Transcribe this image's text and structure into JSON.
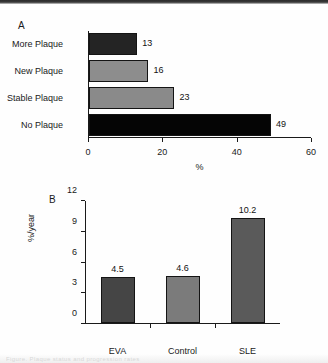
{
  "figure": {
    "background_color": "#fefefe",
    "ink_color": "#1a1a1a",
    "caption_ghost": "Figure. Plaque status and progression rates"
  },
  "panel_a": {
    "label": "A",
    "chart_data": {
      "type": "bar",
      "orientation": "horizontal",
      "title": "",
      "categories": [
        "More Plaque",
        "New Plaque",
        "Stable Plaque",
        "No Plaque"
      ],
      "values": [
        13,
        16,
        23,
        49
      ],
      "value_labels": [
        "13",
        "16",
        "23",
        "49"
      ],
      "bar_colors": [
        "#242424",
        "#8d8d8d",
        "#8a8a8a",
        "#050505"
      ],
      "xlabel": "%",
      "ylabel": "",
      "xlim": [
        0,
        60
      ],
      "xticks": [
        0,
        20,
        40,
        60
      ],
      "xtick_labels": [
        "0",
        "20",
        "40",
        "60"
      ],
      "grid": false,
      "legend": false
    }
  },
  "panel_b": {
    "label": "B",
    "chart_data": {
      "type": "bar",
      "orientation": "vertical",
      "title": "",
      "categories": [
        "EVA",
        "Control",
        "SLE"
      ],
      "values": [
        4.5,
        4.6,
        10.2
      ],
      "value_labels": [
        "4.5",
        "4.6",
        "10.2"
      ],
      "bar_colors": [
        "#454545",
        "#7b7b7b",
        "#5a5a5a"
      ],
      "xlabel": "",
      "ylabel": "%/year",
      "ylim": [
        0,
        12
      ],
      "yticks": [
        0,
        3,
        6,
        9,
        12
      ],
      "ytick_labels": [
        "0",
        "3",
        "6",
        "9",
        "12"
      ],
      "grid": false,
      "legend": false
    }
  }
}
